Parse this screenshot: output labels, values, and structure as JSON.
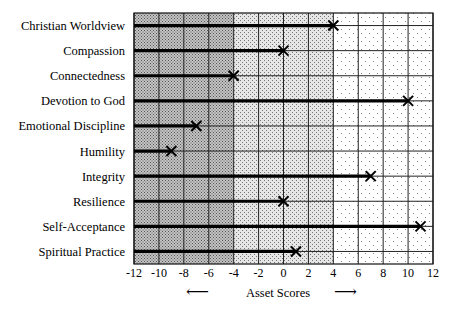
{
  "chart_data": {
    "type": "bar",
    "orientation": "horizontal",
    "title": "",
    "xlabel": "Asset Scores",
    "ylabel": "",
    "xlim": [
      -12,
      12
    ],
    "x_ticks": [
      -12,
      -10,
      -8,
      -6,
      -4,
      -2,
      0,
      2,
      4,
      6,
      8,
      10,
      12
    ],
    "grid": true,
    "legend": null,
    "shaded_zones": [
      {
        "range": [
          -12,
          -4
        ],
        "shade": "dark"
      },
      {
        "range": [
          -4,
          4
        ],
        "shade": "medium"
      },
      {
        "range": [
          4,
          12
        ],
        "shade": "light"
      }
    ],
    "marker": "X",
    "categories": [
      "Christian Worldview",
      "Compassion",
      "Connectedness",
      "Devotion to God",
      "Emotional Discipline",
      "Humility",
      "Integrity",
      "Resilience",
      "Self-Acceptance",
      "Spiritual Practice"
    ],
    "values": [
      4,
      0,
      -4,
      10,
      -7,
      -9,
      7,
      0,
      11,
      1
    ],
    "arrows": {
      "left": "←",
      "right": "→"
    }
  }
}
